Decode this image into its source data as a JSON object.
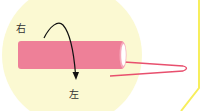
{
  "diagram": {
    "labels": {
      "right": "右",
      "left": "左"
    },
    "colors": {
      "background_circle": "#FBF9D2",
      "tube": "#EE8098",
      "tube_end": "#FFFFFF",
      "wire": "#E8506E",
      "arrow": "#111111",
      "frame_line": "#F7EE5C"
    },
    "elements": {
      "tube": "pink-tube",
      "wire": "pink-wire",
      "arrow": "curved-rotation-arrow"
    }
  }
}
